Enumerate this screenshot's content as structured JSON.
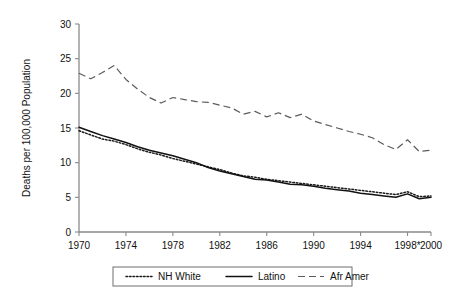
{
  "chart_data": {
    "type": "line",
    "title": "",
    "xlabel": "",
    "ylabel": "Deaths per 100,000 Population",
    "xlim": [
      1970,
      2000
    ],
    "ylim": [
      0,
      30
    ],
    "grid": false,
    "legend_position": "bottom-center",
    "x_tick_labels": [
      "1970",
      "1974",
      "1978",
      "1982",
      "1986",
      "1990",
      "1994",
      "1998*",
      "2000"
    ],
    "x_tick_values": [
      1970,
      1974,
      1978,
      1982,
      1986,
      1990,
      1994,
      1998,
      2000
    ],
    "y_tick_labels": [
      "0",
      "5",
      "10",
      "15",
      "20",
      "25",
      "30"
    ],
    "y_tick_values": [
      0,
      5,
      10,
      15,
      20,
      25,
      30
    ],
    "x": [
      1970,
      1971,
      1972,
      1973,
      1974,
      1975,
      1976,
      1977,
      1978,
      1979,
      1980,
      1981,
      1982,
      1983,
      1984,
      1985,
      1986,
      1987,
      1988,
      1989,
      1990,
      1991,
      1992,
      1993,
      1994,
      1995,
      1996,
      1997,
      1998,
      1999,
      2000
    ],
    "series": [
      {
        "name": "NH White",
        "style": "dotted",
        "color": "#1a1a1a",
        "values": [
          14.6,
          14.0,
          13.4,
          13.1,
          12.6,
          12.0,
          11.5,
          11.1,
          10.6,
          10.2,
          9.8,
          9.4,
          9.0,
          8.5,
          8.1,
          7.9,
          7.6,
          7.4,
          7.2,
          7.0,
          6.8,
          6.6,
          6.4,
          6.2,
          6.0,
          5.8,
          5.6,
          5.4,
          5.8,
          5.1,
          5.2
        ]
      },
      {
        "name": "Latino",
        "style": "solid",
        "color": "#111111",
        "values": [
          15.1,
          14.5,
          13.9,
          13.4,
          12.9,
          12.3,
          11.8,
          11.4,
          11.0,
          10.5,
          10.0,
          9.3,
          8.8,
          8.4,
          8.0,
          7.6,
          7.5,
          7.2,
          6.9,
          6.8,
          6.6,
          6.3,
          6.1,
          5.9,
          5.6,
          5.4,
          5.2,
          5.0,
          5.5,
          4.8,
          5.0
        ]
      },
      {
        "name": "Afr Amer",
        "style": "dashed",
        "color": "#5b5b5b",
        "values": [
          22.9,
          22.1,
          23.0,
          24.0,
          22.0,
          20.6,
          19.4,
          18.6,
          19.4,
          19.1,
          18.8,
          18.7,
          18.3,
          17.9,
          17.0,
          17.4,
          16.6,
          17.2,
          16.5,
          17.0,
          16.0,
          15.5,
          15.0,
          14.5,
          14.1,
          13.6,
          12.6,
          11.9,
          13.3,
          11.6,
          11.8
        ]
      }
    ],
    "legend": [
      {
        "label": "NH White",
        "style": "dotted"
      },
      {
        "label": "Latino",
        "style": "solid"
      },
      {
        "label": "Afr Amer",
        "style": "dashed"
      }
    ]
  }
}
